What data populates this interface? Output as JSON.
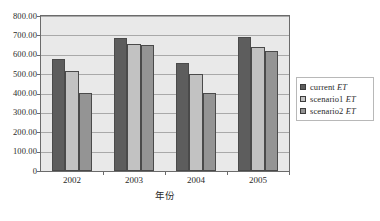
{
  "chart_data": {
    "type": "bar",
    "title": "",
    "xlabel": "年份",
    "ylabel": "",
    "categories": [
      "2002",
      "2003",
      "2004",
      "2005"
    ],
    "ylim": [
      0,
      800
    ],
    "ytick_labels": [
      "800.00",
      "700.00",
      "600.00",
      "500.00",
      "400.00",
      "300.00",
      "200.00",
      "100.00",
      "0"
    ],
    "ytick_values": [
      800,
      700,
      600,
      500,
      400,
      300,
      200,
      100,
      0
    ],
    "grid": true,
    "legend_position": "right",
    "series": [
      {
        "name": "current ET",
        "name_prefix": "current ",
        "name_italic": "ET",
        "color": "#5d5d5d",
        "values": [
          580,
          688,
          556,
          692
        ]
      },
      {
        "name": "scenario1 ET",
        "name_prefix": "scenario1 ",
        "name_italic": "ET",
        "color": "#c2c2c2",
        "values": [
          518,
          657,
          500,
          638
        ]
      },
      {
        "name": "scenario2 ET",
        "name_prefix": "scenario2 ",
        "name_italic": "ET",
        "color": "#949494",
        "values": [
          402,
          653,
          403,
          618
        ]
      }
    ]
  },
  "caption_remnant": "· · · · · · · · · ·"
}
